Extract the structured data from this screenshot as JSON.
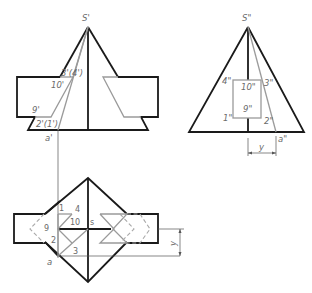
{
  "front_view": {
    "labels": {
      "apex": "S'",
      "p3p4": "3'(4')",
      "p10": "10'",
      "p9": "9'",
      "p2p1": "2'(1')",
      "a": "a'"
    }
  },
  "side_view": {
    "labels": {
      "apex": "S\"",
      "p4": "4\"",
      "p10": "10\"",
      "p3": "3\"",
      "p9": "9\"",
      "p1": "1\"",
      "p2": "2\"",
      "a": "a\"",
      "dim_y": "y"
    }
  },
  "top_view": {
    "labels": {
      "p1": "1",
      "p4": "4",
      "p9": "9",
      "p10": "10",
      "s": "s",
      "p2": "2",
      "p3": "3",
      "a": "a",
      "dim_y": "y"
    }
  },
  "colors": {
    "visible_edge": "#1a1a1a",
    "construction": "#9a9a9a"
  }
}
